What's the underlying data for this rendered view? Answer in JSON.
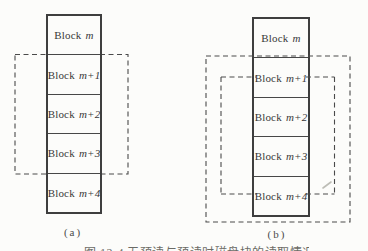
{
  "colors": {
    "background": "#fcfcfa",
    "block_border": "#3e3e3e",
    "dashed_line": "#4a4a4a",
    "label_text": "#383838",
    "caption_text": "#6b6b66",
    "scan_artifact": "#bdbdb6"
  },
  "figure": {
    "panel_a": {
      "label": "(a)",
      "blocks": [
        {
          "word": "Block",
          "math": "m"
        },
        {
          "word": "Block",
          "math": "m+1"
        },
        {
          "word": "Block",
          "math": "m+2"
        },
        {
          "word": "Block",
          "math": "m+3"
        },
        {
          "word": "Block",
          "math": "m+4"
        }
      ]
    },
    "panel_b": {
      "label": "(b)",
      "blocks": [
        {
          "word": "Block",
          "math": "m"
        },
        {
          "word": "Block",
          "math": "m+1"
        },
        {
          "word": "Block",
          "math": "m+2"
        },
        {
          "word": "Block",
          "math": "m+3"
        },
        {
          "word": "Block",
          "math": "m+4"
        }
      ]
    },
    "caption": "图 12-4 无预读与预读时磁盘块的读取情况"
  }
}
